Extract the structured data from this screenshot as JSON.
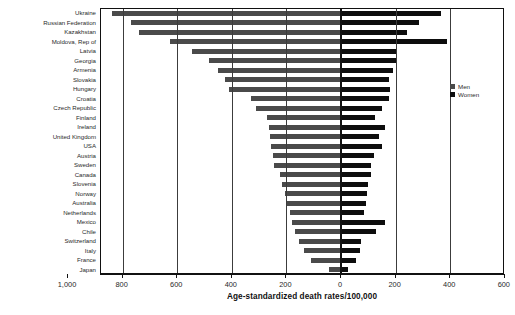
{
  "chart_data": {
    "type": "bar",
    "orientation": "horizontal-diverging",
    "title": "",
    "subtitle": "",
    "xlabel": "Age-standardized death rates/100,000",
    "ylabel": "",
    "grid": true,
    "legend_position": "right",
    "left_axis": {
      "max": 1000,
      "min": 0,
      "direction": "reversed"
    },
    "right_axis": {
      "max": 600,
      "min": 0
    },
    "xtick_labels": [
      "1,000",
      "800",
      "600",
      "400",
      "200",
      "0",
      "200",
      "400",
      "600"
    ],
    "xtick_values": [
      1000,
      800,
      600,
      400,
      200,
      0,
      200,
      400,
      600
    ],
    "legend": [
      {
        "name": "Men",
        "color": "#4a4a4a"
      },
      {
        "name": "Women",
        "color": "#0d0d0d"
      }
    ],
    "categories": [
      "Ukraine",
      "Russian Federation",
      "Kazakhstan",
      "Moldova, Rep of",
      "Latvia",
      "Georgia",
      "Armenia",
      "Slovakia",
      "Hungary",
      "Croatia",
      "Czech Republic",
      "Finland",
      "Ireland",
      "United Kingdom",
      "USA",
      "Austria",
      "Sweden",
      "Canada",
      "Slovenia",
      "Norway",
      "Australia",
      "Netherlands",
      "Mexico",
      "Chile",
      "Switzerland",
      "Italy",
      "France",
      "Japan"
    ],
    "series": [
      {
        "name": "Men",
        "color": "#4a4a4a",
        "values": [
          840,
          770,
          740,
          625,
          545,
          485,
          450,
          425,
          410,
          330,
          310,
          270,
          265,
          260,
          255,
          250,
          245,
          225,
          215,
          205,
          200,
          185,
          180,
          170,
          155,
          135,
          110,
          45
        ]
      },
      {
        "name": "Women",
        "color": "#0d0d0d",
        "values": [
          365,
          285,
          240,
          390,
          205,
          200,
          190,
          175,
          180,
          175,
          150,
          125,
          160,
          140,
          150,
          120,
          110,
          110,
          100,
          95,
          90,
          85,
          160,
          130,
          75,
          70,
          55,
          25
        ]
      }
    ]
  }
}
